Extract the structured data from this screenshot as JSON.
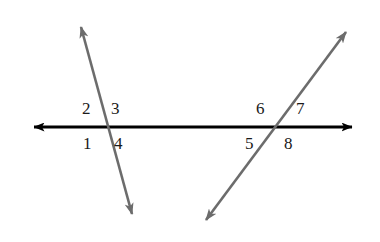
{
  "canvas": {
    "width": 380,
    "height": 242,
    "background_color": "#ffffff"
  },
  "figure": {
    "lines": [
      {
        "name": "horizontal-line",
        "color": "#000000",
        "stroke_width": 3.2,
        "x1": 28,
        "y1": 127,
        "x2": 358,
        "y2": 127,
        "arrow_start": true,
        "arrow_end": true
      },
      {
        "name": "left-transversal",
        "color": "#6c6c6c",
        "stroke_width": 2.6,
        "x1": 79,
        "y1": 20,
        "x2": 134,
        "y2": 221,
        "arrow_start": true,
        "arrow_end": true
      },
      {
        "name": "right-transversal",
        "color": "#6c6c6c",
        "stroke_width": 2.6,
        "x1": 351,
        "y1": 25,
        "x2": 201,
        "y2": 227,
        "arrow_start": true,
        "arrow_end": true
      }
    ],
    "intersections": [
      {
        "name": "left-intersection",
        "x": 104,
        "y": 127
      },
      {
        "name": "right-intersection",
        "x": 276,
        "y": 127
      }
    ]
  },
  "angle_labels": [
    {
      "id": "angle-2",
      "text": "2",
      "x": 82,
      "y": 100,
      "position": "upper-left-of-left-intersection"
    },
    {
      "id": "angle-3",
      "text": "3",
      "x": 111,
      "y": 100,
      "position": "upper-right-of-left-intersection"
    },
    {
      "id": "angle-1",
      "text": "1",
      "x": 83,
      "y": 135,
      "position": "lower-left-of-left-intersection"
    },
    {
      "id": "angle-4",
      "text": "4",
      "x": 114,
      "y": 135,
      "position": "lower-right-of-left-intersection"
    },
    {
      "id": "angle-6",
      "text": "6",
      "x": 256,
      "y": 100,
      "position": "upper-left-of-right-intersection"
    },
    {
      "id": "angle-7",
      "text": "7",
      "x": 296,
      "y": 100,
      "position": "upper-right-of-right-intersection"
    },
    {
      "id": "angle-5",
      "text": "5",
      "x": 245,
      "y": 135,
      "position": "lower-left-of-right-intersection"
    },
    {
      "id": "angle-8",
      "text": "8",
      "x": 284,
      "y": 135,
      "position": "lower-right-of-right-intersection"
    }
  ],
  "background_artifacts": [
    {
      "id": "ghost-top",
      "text": "",
      "x": 0,
      "y": 0,
      "size": 0
    },
    {
      "id": "ghost-bottom-left",
      "text": "",
      "x": 0,
      "y": 195,
      "size": 18
    },
    {
      "id": "ghost-bottom-right",
      "text": "",
      "x": 215,
      "y": 178,
      "size": 22
    }
  ]
}
